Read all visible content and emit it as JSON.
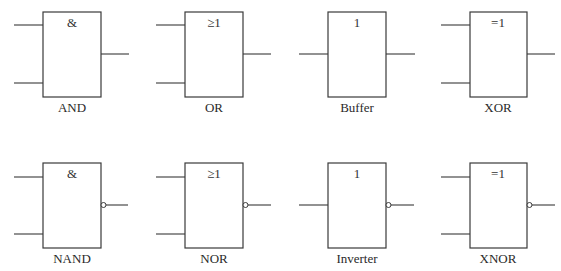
{
  "diagram": {
    "colors": {
      "line": "#3a3a3a",
      "background": "#ffffff"
    },
    "gates": [
      {
        "name": "AND",
        "symbol": "&",
        "label": "AND",
        "inputs": 2,
        "inverted_output": false
      },
      {
        "name": "OR",
        "symbol": "≥1",
        "label": "OR",
        "inputs": 2,
        "inverted_output": false
      },
      {
        "name": "Buffer",
        "symbol": "1",
        "label": "Buffer",
        "inputs": 1,
        "inverted_output": false
      },
      {
        "name": "XOR",
        "symbol": "=1",
        "label": "XOR",
        "inputs": 2,
        "inverted_output": false
      },
      {
        "name": "NAND",
        "symbol": "&",
        "label": "NAND",
        "inputs": 2,
        "inverted_output": true
      },
      {
        "name": "NOR",
        "symbol": "≥1",
        "label": "NOR",
        "inputs": 2,
        "inverted_output": true
      },
      {
        "name": "Inverter",
        "symbol": "1",
        "label": "Inverter",
        "inputs": 1,
        "inverted_output": true
      },
      {
        "name": "XNOR",
        "symbol": "=1",
        "label": "XNOR",
        "inputs": 2,
        "inverted_output": true
      }
    ]
  }
}
